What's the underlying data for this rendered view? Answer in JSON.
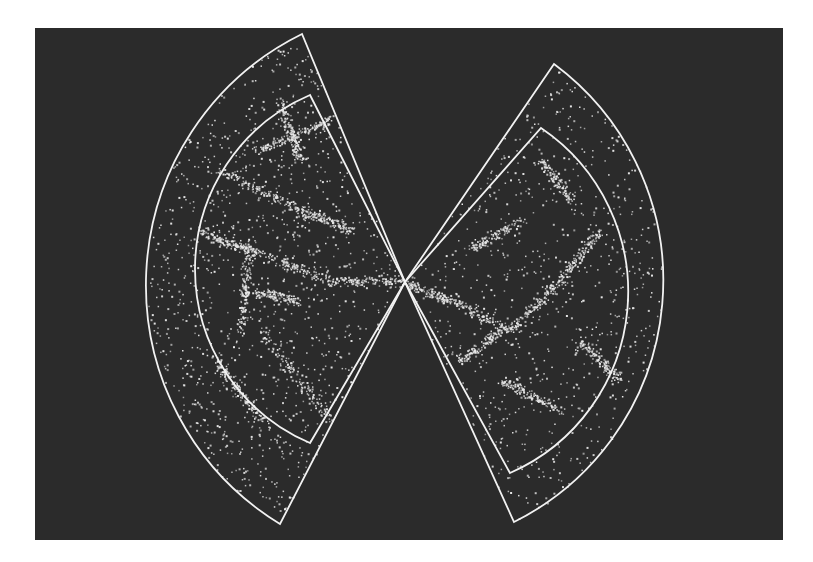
{
  "figure": {
    "background_color": "#2b2b2b",
    "page_color": "#ffffff",
    "line_color": "#f2f2f2",
    "point_color": "#e8e8e8",
    "observer": {
      "x": 405,
      "y": 282
    },
    "wedges": [
      {
        "name": "left-wedge",
        "outer": {
          "top": [
            302,
            34
          ],
          "bottom": [
            280,
            524
          ],
          "arc_extreme_x": 146
        },
        "inner": {
          "top": [
            310,
            95
          ],
          "bottom": [
            310,
            443
          ],
          "arc_extreme_x": 195
        }
      },
      {
        "name": "right-wedge",
        "outer": {
          "top": [
            554,
            64
          ],
          "bottom": [
            514,
            522
          ],
          "arc_extreme_x": 663
        },
        "inner": {
          "top": [
            541,
            128
          ],
          "bottom": [
            510,
            473
          ],
          "arc_extreme_x": 628
        }
      }
    ],
    "point_density": {
      "left": 2600,
      "right": 1900
    }
  }
}
